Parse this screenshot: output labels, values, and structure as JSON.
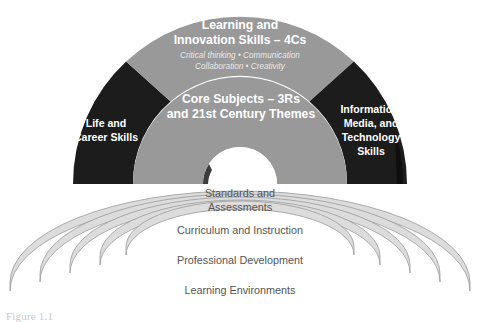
{
  "figure": {
    "caption": "Figure 1.1"
  },
  "arcs": {
    "outer": [
      {
        "id": "life-career",
        "label_lines": [
          "Life and",
          "Career Skills"
        ],
        "line1": "Life and",
        "line2": "Career Skills",
        "color": "#1c1c1c",
        "text_color": "#ffffff"
      },
      {
        "id": "learning-innovation",
        "line1": "Learning and",
        "line2": "Innovation Skills – 4Cs",
        "sub1": "Critical thinking • Communication",
        "sub2": "Collaboration • Creativity",
        "color": "#999999",
        "text_color": "#ffffff"
      },
      {
        "id": "information-media-technology",
        "line1": "Information,",
        "line2": "Media, and",
        "line3": "Technology",
        "line4": "Skills",
        "color": "#1c1c1c",
        "text_color": "#ffffff"
      }
    ],
    "inner": {
      "id": "core-subjects",
      "line1": "Core Subjects – 3Rs",
      "line2": "and 21st Century Themes",
      "color": "#999999",
      "text_color": "#ffffff"
    }
  },
  "support_rings": [
    {
      "id": "standards-assessments",
      "line1": "Standards and",
      "line2": "Assessments",
      "color": "#dcdcdc"
    },
    {
      "id": "curriculum-instruction",
      "line1": "Curriculum and Instruction",
      "color": "#dcdcdc"
    },
    {
      "id": "professional-development",
      "line1": "Professional Development",
      "color": "#dcdcdc"
    },
    {
      "id": "learning-environments",
      "line1": "Learning Environments",
      "color": "#dcdcdc"
    }
  ],
  "colors": {
    "dark_segment": "#1c1c1c",
    "gray_segment": "#999999",
    "ring_fill": "#dcdcdc",
    "ring_stroke": "#9b9b9b",
    "ring_text": "#555555",
    "background": "#ffffff"
  }
}
